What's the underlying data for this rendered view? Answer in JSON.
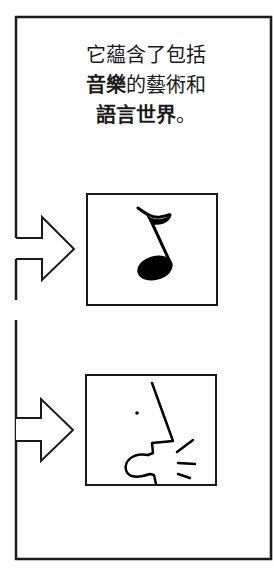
{
  "caption": {
    "line1": "它蘊含了包括",
    "line2_bold": "音樂",
    "line2_rest": "的藝術和",
    "line3_bold": "語言世界",
    "line3_rest": "。"
  },
  "panels": [
    {
      "id": "music",
      "icon": "eighth-note-icon",
      "description": "音樂"
    },
    {
      "id": "speech",
      "icon": "speaking-face-icon",
      "description": "語言"
    }
  ],
  "colors": {
    "stroke": "#1a1a1a",
    "background": "#ffffff"
  }
}
